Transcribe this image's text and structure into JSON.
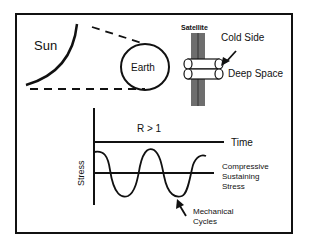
{
  "labels": {
    "sun": "Sun",
    "earth": "Earth",
    "satellite": "Satellite",
    "cold_side": "Cold Side",
    "deep_space": "Deep Space",
    "ratio": "R > 1",
    "time_axis": "Time",
    "stress_axis": "Stress",
    "compressive_line1": "Compressive",
    "compressive_line2": "Sustaining",
    "compressive_line3": "Stress",
    "mechanical_line1": "Mechanical",
    "mechanical_line2": "Cycles"
  },
  "colors": {
    "stroke": "#111111",
    "satellite_body": "#6e6e6e",
    "background": "#ffffff"
  }
}
